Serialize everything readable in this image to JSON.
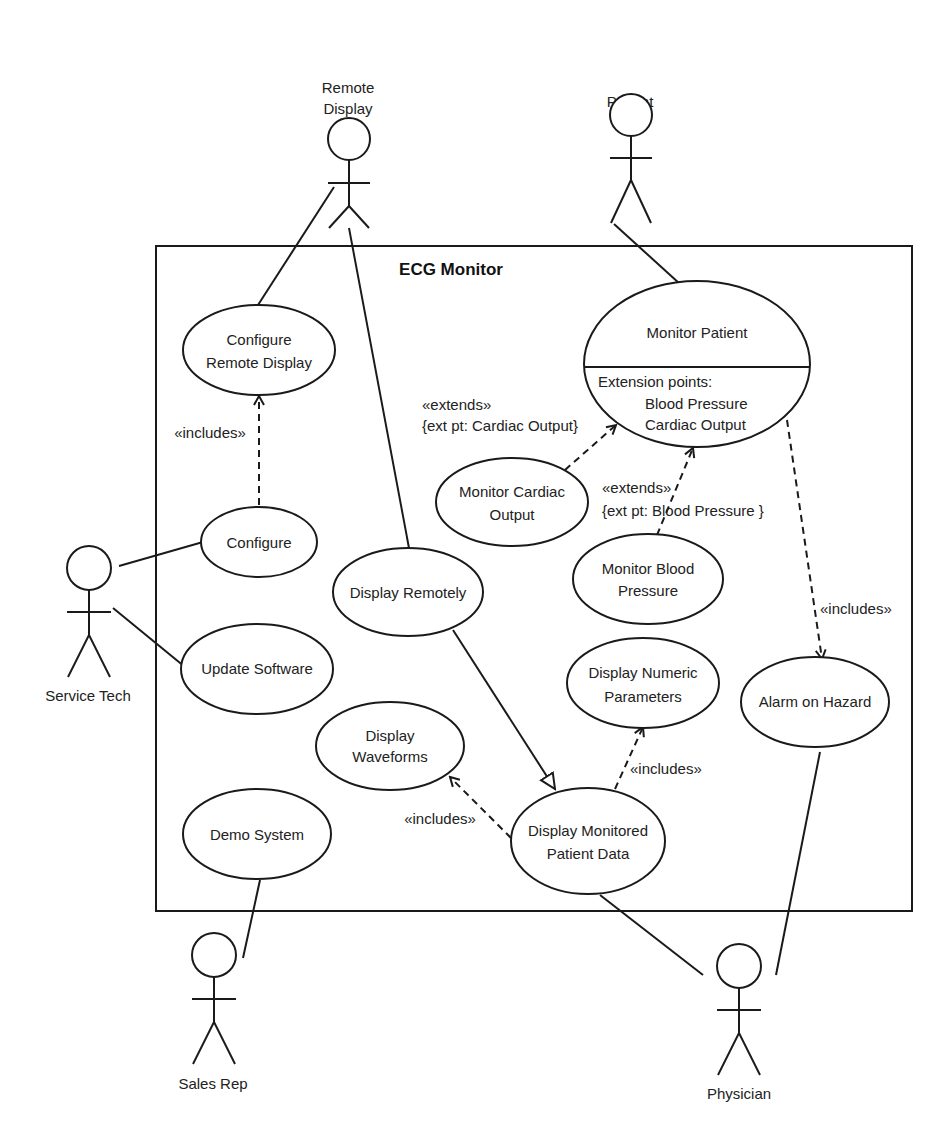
{
  "system": {
    "title": "ECG Monitor"
  },
  "actors": {
    "remote_display": {
      "line1": "Remote",
      "line2": "Display"
    },
    "patient": {
      "label": "Patient"
    },
    "service_tech": {
      "label": "Service Tech"
    },
    "sales_rep": {
      "label": "Sales Rep"
    },
    "physician": {
      "label": "Physician"
    }
  },
  "use_cases": {
    "configure_remote_display": {
      "line1": "Configure",
      "line2": "Remote Display"
    },
    "monitor_patient": {
      "title": "Monitor Patient",
      "ext_header": "Extension points:",
      "ext_points": [
        "Blood Pressure",
        "Cardiac Output"
      ]
    },
    "configure": {
      "label": "Configure"
    },
    "monitor_cardiac_output": {
      "line1": "Monitor Cardiac",
      "line2": "Output"
    },
    "monitor_blood_pressure": {
      "line1": "Monitor Blood",
      "line2": "Pressure"
    },
    "display_remotely": {
      "label": "Display Remotely"
    },
    "update_software": {
      "label": "Update Software"
    },
    "display_numeric_parameters": {
      "line1": "Display Numeric",
      "line2": "Parameters"
    },
    "alarm_on_hazard": {
      "label": "Alarm on Hazard"
    },
    "display_waveforms": {
      "line1": "Display",
      "line2": "Waveforms"
    },
    "demo_system": {
      "label": "Demo System"
    },
    "display_monitored_patient_data": {
      "line1": "Display Monitored",
      "line2": "Patient Data"
    }
  },
  "relationships": {
    "includes_configure_remote": "«includes»",
    "extends_cardiac": {
      "stereotype": "«extends»",
      "constraint": "{ext pt: Cardiac Output}"
    },
    "extends_blood": {
      "stereotype": "«extends»",
      "constraint": "{ext pt: Blood Pressure }"
    },
    "includes_alarm": "«includes»",
    "includes_numeric": "«includes»",
    "includes_waveforms": "«includes»"
  }
}
